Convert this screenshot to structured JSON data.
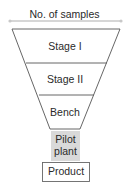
{
  "diagram": {
    "type": "funnel",
    "header_label": "No. of samples",
    "stages": [
      {
        "label": "Stage I"
      },
      {
        "label": "Stage II"
      },
      {
        "label": "Bench"
      }
    ],
    "pilot": {
      "line1": "Pilot",
      "line2": "plant"
    },
    "output": {
      "label": "Product"
    },
    "colors": {
      "line": "#555555",
      "arrow": "#c8c8c8",
      "pilot_fill": "#d9d9d9",
      "text": "#2a2a2a"
    }
  }
}
